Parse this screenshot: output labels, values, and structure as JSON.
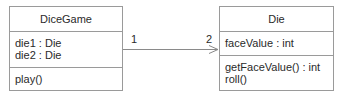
{
  "classes": {
    "dicegame": {
      "name": "DiceGame",
      "attributes": [
        "die1 : Die",
        "die2 : Die"
      ],
      "operations": [
        "play()"
      ]
    },
    "die": {
      "name": "Die",
      "attributes": [
        "faceValue : int"
      ],
      "operations": [
        "getFaceValue() : int",
        "roll()"
      ]
    }
  },
  "association": {
    "source_multiplicity": "1",
    "target_multiplicity": "2",
    "arrow": "open-navigable"
  },
  "colors": {
    "border": "#9a9a9a",
    "text": "#2a2a2a",
    "background": "#ffffff"
  }
}
